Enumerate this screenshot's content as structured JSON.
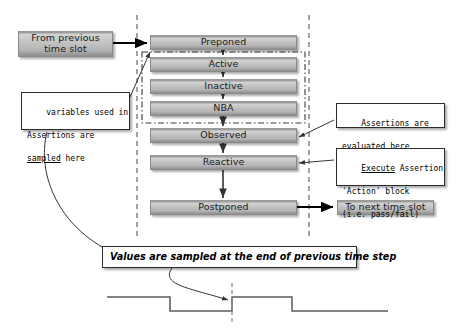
{
  "diagram": {
    "colors": {
      "box_fill_light": "#d4d4d4",
      "box_fill_dark": "#8f8f8f",
      "box_border": "#8a8a8a",
      "callout_border": "#2b2b2b",
      "line": "#000000",
      "dashed_line": "#8c8c8c",
      "waveform": "#5b5b5b",
      "background": "#ffffff"
    },
    "regions": [
      {
        "id": "preponed",
        "label": "Preponed",
        "x": 150,
        "y": 35,
        "w": 147,
        "h": 15
      },
      {
        "id": "active",
        "label": "Active",
        "x": 150,
        "y": 57,
        "w": 147,
        "h": 15
      },
      {
        "id": "inactive",
        "label": "Inactive",
        "x": 150,
        "y": 79,
        "w": 147,
        "h": 15
      },
      {
        "id": "nba",
        "label": "NBA",
        "x": 150,
        "y": 101,
        "w": 147,
        "h": 15
      },
      {
        "id": "observed",
        "label": "Observed",
        "x": 150,
        "y": 128,
        "w": 147,
        "h": 15
      },
      {
        "id": "reactive",
        "label": "Reactive",
        "x": 150,
        "y": 155,
        "w": 147,
        "h": 15
      },
      {
        "id": "postponed",
        "label": "Postponed",
        "x": 150,
        "y": 200,
        "w": 147,
        "h": 15
      }
    ],
    "entry_box": {
      "label": "From previous time slot",
      "x": 18,
      "y": 31,
      "w": 95,
      "h": 26
    },
    "exit_box": {
      "label": "To next time slot",
      "x": 337,
      "y": 200,
      "w": 97,
      "h": 15
    },
    "callouts": [
      {
        "id": "sampled-here",
        "lines": [
          "variables used in",
          "Assertions are",
          "sampled here"
        ],
        "underline_word": "sampled",
        "x": 21,
        "y": 92,
        "w": 109,
        "h": 38
      },
      {
        "id": "assertions-evaluated",
        "lines": [
          "Assertions are",
          "evaluated here"
        ],
        "underline_word": "evaluated",
        "x": 336,
        "y": 103,
        "w": 109,
        "h": 25
      },
      {
        "id": "execute-assertion",
        "lines": [
          "Execute Assertion",
          "'Action' block",
          "(i.e. pass/fail)"
        ],
        "underline_word": "Execute",
        "x": 336,
        "y": 148,
        "w": 109,
        "h": 38
      }
    ],
    "note_box": {
      "label": "Values are sampled at the end of previous time step",
      "x": 102,
      "y": 246,
      "w": 255,
      "h": 22
    },
    "loop_group": {
      "label": "active-inactive-nba-loop",
      "x": 142,
      "y": 52,
      "w": 163,
      "h": 71
    },
    "boundaries": [
      {
        "id": "time-slot-start-boundary",
        "x": 137,
        "y1": 15,
        "y2": 237
      },
      {
        "id": "time-slot-end-boundary",
        "x": 309,
        "y1": 15,
        "y2": 237
      }
    ],
    "waveform": {
      "label": "clock-waveform",
      "high_y": 297,
      "low_y": 311,
      "x_start": 107,
      "x_end": 388,
      "edges": [
        170,
        232,
        292,
        355
      ],
      "sample_marker_x": 232,
      "marker_y1": 283,
      "marker_y2": 324
    }
  }
}
